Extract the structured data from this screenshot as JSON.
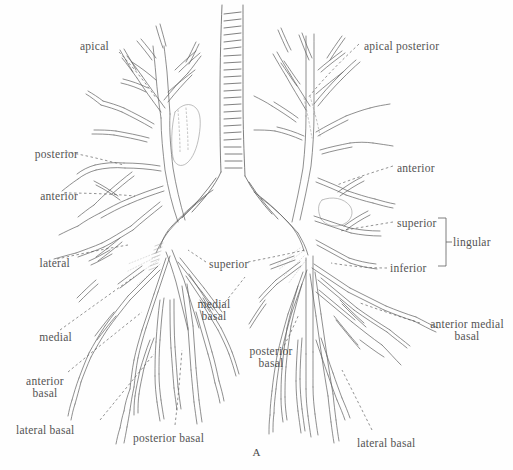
{
  "figure": {
    "letter": "A",
    "ink_color": "#3a3a3a",
    "background_color": "#fefefe"
  },
  "labels": {
    "left_lung_apical": "apical",
    "left_posterior": "posterior",
    "left_anterior": "anterior",
    "left_lateral": "lateral",
    "left_medial": "medial",
    "left_anterior_basal": "anterior\nbasal",
    "left_lateral_basal": "lateral basal",
    "left_posterior_basal": "posterior basal",
    "center_superior": "superior",
    "center_medial_basal": "medial\nbasal",
    "center_posterior_basal": "posterior\nbasal",
    "right_apical_posterior": "apical posterior",
    "right_anterior": "anterior",
    "right_superior": "superior",
    "right_inferior": "inferior",
    "right_lingular": "lingular",
    "right_anterior_medial_basal": "anterior medial\nbasal",
    "right_lateral_basal": "lateral basal"
  },
  "label_list": [
    {
      "name": "apical",
      "text": "apical",
      "side": "left",
      "x": 80,
      "y": 40
    },
    {
      "name": "posterior",
      "text": "posterior",
      "side": "left",
      "x": 12,
      "y": 148
    },
    {
      "name": "anterior",
      "text": "anterior",
      "side": "left",
      "x": 12,
      "y": 190
    },
    {
      "name": "lateral",
      "text": "lateral",
      "side": "left",
      "x": 12,
      "y": 257
    },
    {
      "name": "medial",
      "text": "medial",
      "side": "left",
      "x": 16,
      "y": 331
    },
    {
      "name": "anterior-basal",
      "text": "anterior basal",
      "side": "left",
      "x": 14,
      "y": 375
    },
    {
      "name": "lateral-basal-left",
      "text": "lateral basal",
      "side": "left",
      "x": 16,
      "y": 424
    },
    {
      "name": "posterior-basal",
      "text": "posterior basal",
      "side": "center",
      "x": 133,
      "y": 432
    },
    {
      "name": "superior-center",
      "text": "superior",
      "side": "center",
      "x": 209,
      "y": 258
    },
    {
      "name": "medial-basal",
      "text": "medial basal",
      "side": "center",
      "x": 192,
      "y": 300
    },
    {
      "name": "posterior-basal-r",
      "text": "posterior basal",
      "side": "center",
      "x": 243,
      "y": 348
    },
    {
      "name": "apical-posterior",
      "text": "apical posterior",
      "side": "right",
      "x": 364,
      "y": 40
    },
    {
      "name": "anterior-right",
      "text": "anterior",
      "side": "right",
      "x": 397,
      "y": 162
    },
    {
      "name": "superior-right",
      "text": "superior",
      "side": "right",
      "x": 397,
      "y": 218
    },
    {
      "name": "inferior-right",
      "text": "inferior",
      "side": "right",
      "x": 390,
      "y": 265
    },
    {
      "name": "lingular",
      "text": "lingular",
      "side": "right",
      "x": 452,
      "y": 242
    },
    {
      "name": "anterior-medial-basal",
      "text": "anterior medial basal",
      "side": "right",
      "x": 425,
      "y": 321
    },
    {
      "name": "lateral-basal-right",
      "text": "lateral basal",
      "side": "right",
      "x": 357,
      "y": 437
    }
  ]
}
